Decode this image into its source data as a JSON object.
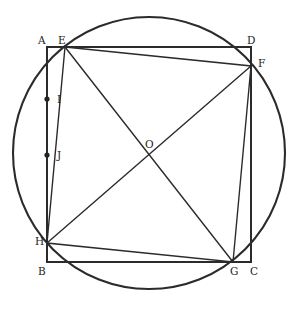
{
  "figure": {
    "kind": "geometry-diagram",
    "canvas": {
      "width": 298,
      "height": 309
    },
    "colors": {
      "stroke": "#2b2b2b",
      "label": "#1c1c1c",
      "background": "#ffffff",
      "dot": "#222222"
    }
  },
  "circle": {
    "name": "circle-O",
    "center": {
      "x": 149,
      "y": 153
    },
    "radius": 136
  },
  "outer_square": {
    "name": "square-ABCD",
    "vertices": [
      {
        "label": "A",
        "x": 47,
        "y": 47
      },
      {
        "label": "D",
        "x": 251,
        "y": 47
      },
      {
        "label": "C",
        "x": 251,
        "y": 262
      },
      {
        "label": "B",
        "x": 47,
        "y": 262
      }
    ]
  },
  "inner_square": {
    "name": "square-EFGH",
    "vertices": [
      {
        "label": "E",
        "x": 65,
        "y": 47
      },
      {
        "label": "F",
        "x": 251,
        "y": 66
      },
      {
        "label": "G",
        "x": 233,
        "y": 262
      },
      {
        "label": "H",
        "x": 47,
        "y": 243
      }
    ]
  },
  "diagonals": [
    {
      "name": "diagonal-EG",
      "from": "E",
      "to": "G",
      "x1": 65,
      "y1": 47,
      "x2": 233,
      "y2": 262
    },
    {
      "name": "diagonal-HF",
      "from": "H",
      "to": "F",
      "x1": 47,
      "y1": 243,
      "x2": 251,
      "y2": 66
    }
  ],
  "marked_points": [
    {
      "label": "I",
      "x": 47,
      "y": 99,
      "dot": true
    },
    {
      "label": "J",
      "x": 47,
      "y": 155,
      "dot": true
    },
    {
      "label": "O",
      "x": 149,
      "y": 155,
      "dot": false
    }
  ],
  "labels": {
    "A": "A",
    "B": "B",
    "C": "C",
    "D": "D",
    "E": "E",
    "F": "F",
    "G": "G",
    "H": "H",
    "I": "I",
    "J": "J",
    "O": "O"
  }
}
